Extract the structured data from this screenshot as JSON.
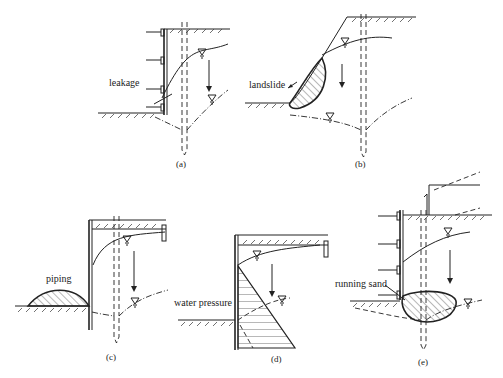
{
  "figure": {
    "panels": [
      {
        "id": "a",
        "caption": "(a)",
        "label": "leakage"
      },
      {
        "id": "b",
        "caption": "(b)",
        "label": "landslide"
      },
      {
        "id": "c",
        "caption": "(c)",
        "label": "piping"
      },
      {
        "id": "d",
        "caption": "(d)",
        "label": "water pressure"
      },
      {
        "id": "e",
        "caption": "(e)",
        "label": "running sand"
      }
    ]
  },
  "colors": {
    "line": "#222222",
    "background": "#ffffff"
  }
}
